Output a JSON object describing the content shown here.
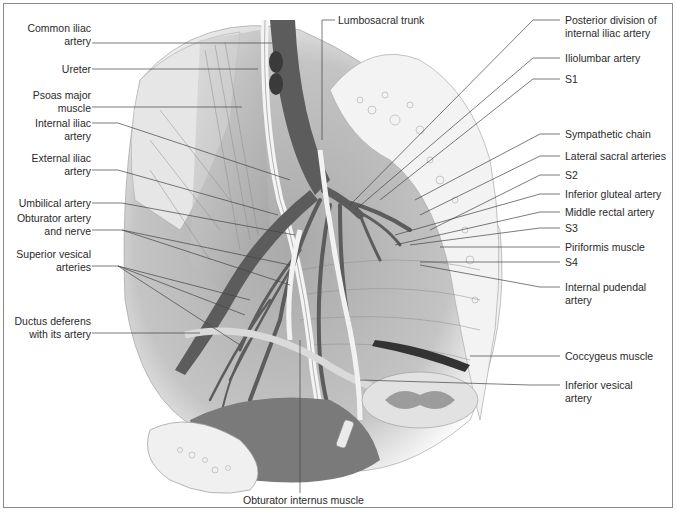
{
  "figure": {
    "labels_left": [
      {
        "id": "common-iliac-artery",
        "lines": [
          "Common iliac",
          "artery"
        ]
      },
      {
        "id": "ureter",
        "lines": [
          "Ureter"
        ]
      },
      {
        "id": "psoas-major-muscle",
        "lines": [
          "Psoas major",
          "muscle"
        ]
      },
      {
        "id": "internal-iliac-artery",
        "lines": [
          "Internal iliac",
          "artery"
        ]
      },
      {
        "id": "external-iliac-artery",
        "lines": [
          "External iliac",
          "artery"
        ]
      },
      {
        "id": "umbilical-artery",
        "lines": [
          "Umbilical artery"
        ]
      },
      {
        "id": "obturator-artery-and-nerve",
        "lines": [
          "Obturator artery",
          "and nerve"
        ]
      },
      {
        "id": "superior-vesical-arteries",
        "lines": [
          "Superior vesical",
          "arteries"
        ]
      },
      {
        "id": "ductus-deferens",
        "lines": [
          "Ductus deferens",
          "with its artery"
        ]
      }
    ],
    "labels_top": [
      {
        "id": "lumbosacral-trunk",
        "lines": [
          "Lumbosacral trunk"
        ]
      }
    ],
    "labels_right": [
      {
        "id": "posterior-division",
        "lines": [
          "Posterior division of",
          "internal iliac artery"
        ]
      },
      {
        "id": "iliolumbar-artery",
        "lines": [
          "Iliolumbar artery"
        ]
      },
      {
        "id": "s1",
        "lines": [
          "S1"
        ]
      },
      {
        "id": "sympathetic-chain",
        "lines": [
          "Sympathetic chain"
        ]
      },
      {
        "id": "lateral-sacral-arteries",
        "lines": [
          "Lateral sacral arteries"
        ]
      },
      {
        "id": "s2",
        "lines": [
          "S2"
        ]
      },
      {
        "id": "inferior-gluteal-artery",
        "lines": [
          "Inferior gluteal artery"
        ]
      },
      {
        "id": "middle-rectal-artery",
        "lines": [
          "Middle rectal artery"
        ]
      },
      {
        "id": "s3",
        "lines": [
          "S3"
        ]
      },
      {
        "id": "piriformis-muscle",
        "lines": [
          "Piriformis muscle"
        ]
      },
      {
        "id": "s4",
        "lines": [
          "S4"
        ]
      },
      {
        "id": "internal-pudendal-artery",
        "lines": [
          "Internal pudendal",
          "artery"
        ]
      },
      {
        "id": "coccygeus-muscle",
        "lines": [
          "Coccygeus muscle"
        ]
      },
      {
        "id": "inferior-vesical-artery",
        "lines": [
          "Inferior vesical",
          "artery"
        ]
      }
    ],
    "labels_bottom": [
      {
        "id": "obturator-internus-muscle",
        "lines": [
          "Obturator internus muscle"
        ]
      }
    ],
    "colors": {
      "artery": "#5c5c5c",
      "muscle": "#b8b8b8",
      "bone": "#ededed",
      "leader": "#444444",
      "border": "#8a8a8a"
    }
  }
}
